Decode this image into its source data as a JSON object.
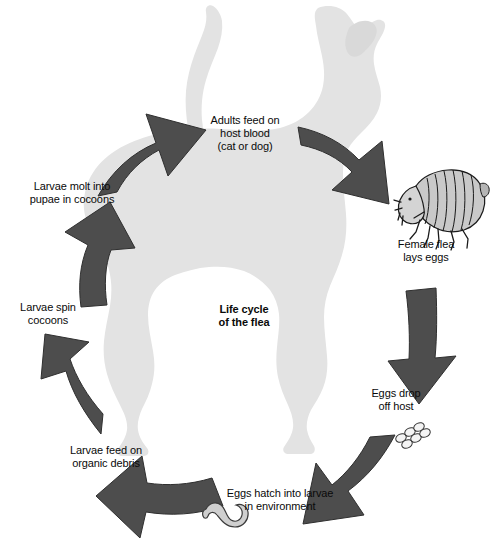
{
  "diagram": {
    "title": "Life cycle\nof the flea",
    "width": 490,
    "height": 541,
    "background_color": "#ffffff",
    "arrow_color": "#4d4d4d",
    "silhouette_color": "#e2e2e2",
    "text_color": "#0a0a0a"
  },
  "stages": [
    {
      "id": "adults-feed",
      "label": "Adults feed on\nhost blood\n(cat or dog)",
      "arrow_name": "arrow-to-adults"
    },
    {
      "id": "female-lays-eggs",
      "label": "Female flea\nlays eggs",
      "arrow_name": "arrow-to-female-flea",
      "illustration": "flea-illustration"
    },
    {
      "id": "eggs-drop",
      "label": "Eggs drop\noff host",
      "arrow_name": "arrow-to-eggs-drop",
      "illustration": "eggs-cluster"
    },
    {
      "id": "eggs-hatch",
      "label": "Eggs hatch into larvae\nin environment",
      "arrow_name": "arrow-to-eggs-hatch",
      "illustration": "larva-illustration"
    },
    {
      "id": "larvae-feed",
      "label": "Larvae feed on\norganic debris",
      "arrow_name": "arrow-to-larvae-feed"
    },
    {
      "id": "larvae-spin",
      "label": "Larvae spin\ncocoons",
      "arrow_name": "arrow-to-larvae-spin"
    },
    {
      "id": "larvae-molt",
      "label": "Larvae molt into\npupae in cocoons",
      "arrow_name": "arrow-to-larvae-molt"
    }
  ],
  "illustrations": {
    "dog_silhouette": "dog-silhouette",
    "flea": "flea",
    "eggs": "eggs",
    "larva": "larva"
  }
}
